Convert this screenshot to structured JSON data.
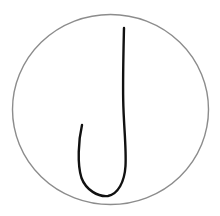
{
  "drawing": {
    "background": "#ffffff",
    "circle": {
      "cx": 110.5,
      "cy": 109.5,
      "rx": 98,
      "ry": 95,
      "stroke": "#8c8c8c",
      "stroke_width": 1.4
    },
    "stroke_path": {
      "d": "M124,28 C123.5,50 122.8,75 123.2,100 C123.6,125 126.5,148 125.5,166 C124.5,182 118,194 108,196 C98,197 86,190 81.5,178 C77,164 78.5,140 82,125",
      "stroke": "#111111",
      "stroke_width": 2.4
    }
  }
}
